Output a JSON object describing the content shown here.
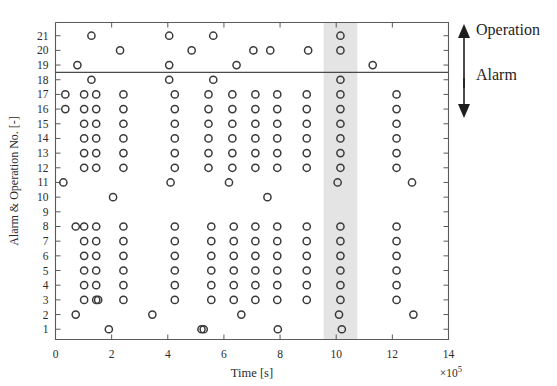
{
  "chart_data": {
    "type": "scatter",
    "title": "",
    "xlabel": "Time [s]",
    "ylabel": "Alarm & Operation No. [-]",
    "x_exponent": "×10",
    "x_exponent_sup": "5",
    "xlim": [
      0,
      14
    ],
    "ylim": [
      0.3,
      21.9
    ],
    "xticks": [
      0,
      2,
      4,
      6,
      8,
      10,
      12,
      14
    ],
    "xticklabels": [
      "0",
      "2",
      "4",
      "6",
      "8",
      "10",
      "12",
      "14"
    ],
    "yticks": [
      1,
      2,
      3,
      4,
      5,
      6,
      7,
      8,
      9,
      10,
      11,
      12,
      13,
      14,
      15,
      16,
      17,
      18,
      19,
      20,
      21
    ],
    "yticklabels": [
      "1",
      "2",
      "3",
      "4",
      "5",
      "6",
      "7",
      "8",
      "9",
      "10",
      "11",
      "12",
      "13",
      "14",
      "15",
      "16",
      "17",
      "18",
      "19",
      "20",
      "21"
    ],
    "grid": false,
    "legend": "none",
    "marker": "open-circle",
    "marker_color": "#3a3a3a",
    "annotations": [
      {
        "name": "operation-label",
        "text": "Operation",
        "arrow": "up"
      },
      {
        "name": "alarm-label",
        "text": "Alarm",
        "arrow": "down"
      }
    ],
    "divider_line": {
      "y": 18.5,
      "label": "alarm-operation-boundary"
    },
    "highlight_band": {
      "x_start": 9.55,
      "x_end": 10.75,
      "color": "#d9d9d9",
      "label": "highlighted-time-window"
    },
    "points": [
      {
        "x": 0.35,
        "y": 17
      },
      {
        "x": 0.35,
        "y": 16
      },
      {
        "x": 0.28,
        "y": 11
      },
      {
        "x": 0.72,
        "y": 8
      },
      {
        "x": 0.72,
        "y": 2
      },
      {
        "x": 0.78,
        "y": 19
      },
      {
        "x": 1.02,
        "y": 17
      },
      {
        "x": 1.02,
        "y": 16
      },
      {
        "x": 1.02,
        "y": 15
      },
      {
        "x": 1.02,
        "y": 14
      },
      {
        "x": 1.02,
        "y": 13
      },
      {
        "x": 1.02,
        "y": 12
      },
      {
        "x": 1.02,
        "y": 8
      },
      {
        "x": 1.02,
        "y": 7
      },
      {
        "x": 1.02,
        "y": 6
      },
      {
        "x": 1.02,
        "y": 5
      },
      {
        "x": 1.02,
        "y": 4
      },
      {
        "x": 1.02,
        "y": 3
      },
      {
        "x": 1.28,
        "y": 21
      },
      {
        "x": 1.28,
        "y": 18
      },
      {
        "x": 1.45,
        "y": 17
      },
      {
        "x": 1.45,
        "y": 16
      },
      {
        "x": 1.45,
        "y": 15
      },
      {
        "x": 1.45,
        "y": 14
      },
      {
        "x": 1.45,
        "y": 13
      },
      {
        "x": 1.45,
        "y": 12
      },
      {
        "x": 1.45,
        "y": 8
      },
      {
        "x": 1.45,
        "y": 7
      },
      {
        "x": 1.45,
        "y": 6
      },
      {
        "x": 1.45,
        "y": 5
      },
      {
        "x": 1.45,
        "y": 4
      },
      {
        "x": 1.45,
        "y": 3
      },
      {
        "x": 1.52,
        "y": 3
      },
      {
        "x": 1.9,
        "y": 1
      },
      {
        "x": 2.05,
        "y": 10
      },
      {
        "x": 2.3,
        "y": 20
      },
      {
        "x": 2.42,
        "y": 17
      },
      {
        "x": 2.42,
        "y": 16
      },
      {
        "x": 2.42,
        "y": 15
      },
      {
        "x": 2.42,
        "y": 14
      },
      {
        "x": 2.42,
        "y": 13
      },
      {
        "x": 2.42,
        "y": 12
      },
      {
        "x": 2.42,
        "y": 8
      },
      {
        "x": 2.42,
        "y": 7
      },
      {
        "x": 2.42,
        "y": 6
      },
      {
        "x": 2.42,
        "y": 5
      },
      {
        "x": 2.42,
        "y": 4
      },
      {
        "x": 2.42,
        "y": 3
      },
      {
        "x": 3.45,
        "y": 2
      },
      {
        "x": 4.05,
        "y": 21
      },
      {
        "x": 4.05,
        "y": 19
      },
      {
        "x": 4.05,
        "y": 18
      },
      {
        "x": 4.1,
        "y": 11
      },
      {
        "x": 4.25,
        "y": 17
      },
      {
        "x": 4.25,
        "y": 16
      },
      {
        "x": 4.25,
        "y": 15
      },
      {
        "x": 4.25,
        "y": 14
      },
      {
        "x": 4.25,
        "y": 13
      },
      {
        "x": 4.25,
        "y": 12
      },
      {
        "x": 4.25,
        "y": 8
      },
      {
        "x": 4.25,
        "y": 7
      },
      {
        "x": 4.25,
        "y": 6
      },
      {
        "x": 4.25,
        "y": 5
      },
      {
        "x": 4.25,
        "y": 4
      },
      {
        "x": 4.25,
        "y": 3
      },
      {
        "x": 4.85,
        "y": 20
      },
      {
        "x": 5.2,
        "y": 1
      },
      {
        "x": 5.28,
        "y": 1
      },
      {
        "x": 5.45,
        "y": 17
      },
      {
        "x": 5.45,
        "y": 16
      },
      {
        "x": 5.45,
        "y": 15
      },
      {
        "x": 5.45,
        "y": 14
      },
      {
        "x": 5.45,
        "y": 13
      },
      {
        "x": 5.45,
        "y": 12
      },
      {
        "x": 5.55,
        "y": 8
      },
      {
        "x": 5.55,
        "y": 7
      },
      {
        "x": 5.55,
        "y": 6
      },
      {
        "x": 5.55,
        "y": 5
      },
      {
        "x": 5.55,
        "y": 4
      },
      {
        "x": 5.55,
        "y": 3
      },
      {
        "x": 5.62,
        "y": 21
      },
      {
        "x": 5.62,
        "y": 18
      },
      {
        "x": 6.18,
        "y": 11
      },
      {
        "x": 6.3,
        "y": 17
      },
      {
        "x": 6.3,
        "y": 16
      },
      {
        "x": 6.3,
        "y": 15
      },
      {
        "x": 6.3,
        "y": 14
      },
      {
        "x": 6.3,
        "y": 13
      },
      {
        "x": 6.3,
        "y": 12
      },
      {
        "x": 6.35,
        "y": 8
      },
      {
        "x": 6.35,
        "y": 7
      },
      {
        "x": 6.35,
        "y": 6
      },
      {
        "x": 6.35,
        "y": 5
      },
      {
        "x": 6.35,
        "y": 4
      },
      {
        "x": 6.35,
        "y": 3
      },
      {
        "x": 6.45,
        "y": 19
      },
      {
        "x": 6.62,
        "y": 2
      },
      {
        "x": 7.05,
        "y": 20
      },
      {
        "x": 7.12,
        "y": 17
      },
      {
        "x": 7.12,
        "y": 16
      },
      {
        "x": 7.12,
        "y": 15
      },
      {
        "x": 7.12,
        "y": 14
      },
      {
        "x": 7.12,
        "y": 13
      },
      {
        "x": 7.12,
        "y": 12
      },
      {
        "x": 7.12,
        "y": 8
      },
      {
        "x": 7.12,
        "y": 7
      },
      {
        "x": 7.12,
        "y": 6
      },
      {
        "x": 7.12,
        "y": 5
      },
      {
        "x": 7.12,
        "y": 4
      },
      {
        "x": 7.12,
        "y": 3
      },
      {
        "x": 7.55,
        "y": 10
      },
      {
        "x": 7.65,
        "y": 20
      },
      {
        "x": 7.9,
        "y": 17
      },
      {
        "x": 7.9,
        "y": 16
      },
      {
        "x": 7.9,
        "y": 15
      },
      {
        "x": 7.9,
        "y": 14
      },
      {
        "x": 7.9,
        "y": 13
      },
      {
        "x": 7.9,
        "y": 12
      },
      {
        "x": 7.9,
        "y": 8
      },
      {
        "x": 7.9,
        "y": 7
      },
      {
        "x": 7.9,
        "y": 6
      },
      {
        "x": 7.9,
        "y": 5
      },
      {
        "x": 7.9,
        "y": 4
      },
      {
        "x": 7.9,
        "y": 3
      },
      {
        "x": 7.92,
        "y": 1
      },
      {
        "x": 8.95,
        "y": 17
      },
      {
        "x": 8.95,
        "y": 16
      },
      {
        "x": 8.95,
        "y": 15
      },
      {
        "x": 8.95,
        "y": 14
      },
      {
        "x": 8.95,
        "y": 13
      },
      {
        "x": 8.95,
        "y": 12
      },
      {
        "x": 8.95,
        "y": 8
      },
      {
        "x": 8.95,
        "y": 7
      },
      {
        "x": 8.95,
        "y": 6
      },
      {
        "x": 8.95,
        "y": 5
      },
      {
        "x": 8.95,
        "y": 4
      },
      {
        "x": 8.95,
        "y": 3
      },
      {
        "x": 9.0,
        "y": 20
      },
      {
        "x": 10.15,
        "y": 21
      },
      {
        "x": 10.15,
        "y": 20
      },
      {
        "x": 10.15,
        "y": 18
      },
      {
        "x": 10.15,
        "y": 17
      },
      {
        "x": 10.15,
        "y": 16
      },
      {
        "x": 10.15,
        "y": 15
      },
      {
        "x": 10.15,
        "y": 14
      },
      {
        "x": 10.15,
        "y": 13
      },
      {
        "x": 10.15,
        "y": 12
      },
      {
        "x": 10.05,
        "y": 11
      },
      {
        "x": 10.15,
        "y": 8
      },
      {
        "x": 10.15,
        "y": 7
      },
      {
        "x": 10.15,
        "y": 6
      },
      {
        "x": 10.15,
        "y": 5
      },
      {
        "x": 10.15,
        "y": 4
      },
      {
        "x": 10.15,
        "y": 3
      },
      {
        "x": 10.1,
        "y": 2
      },
      {
        "x": 10.2,
        "y": 1
      },
      {
        "x": 11.3,
        "y": 19
      },
      {
        "x": 12.15,
        "y": 17
      },
      {
        "x": 12.15,
        "y": 16
      },
      {
        "x": 12.15,
        "y": 15
      },
      {
        "x": 12.15,
        "y": 14
      },
      {
        "x": 12.15,
        "y": 13
      },
      {
        "x": 12.15,
        "y": 12
      },
      {
        "x": 12.15,
        "y": 8
      },
      {
        "x": 12.15,
        "y": 7
      },
      {
        "x": 12.15,
        "y": 6
      },
      {
        "x": 12.15,
        "y": 5
      },
      {
        "x": 12.15,
        "y": 4
      },
      {
        "x": 12.15,
        "y": 3
      },
      {
        "x": 12.7,
        "y": 11
      },
      {
        "x": 12.75,
        "y": 2
      }
    ]
  }
}
